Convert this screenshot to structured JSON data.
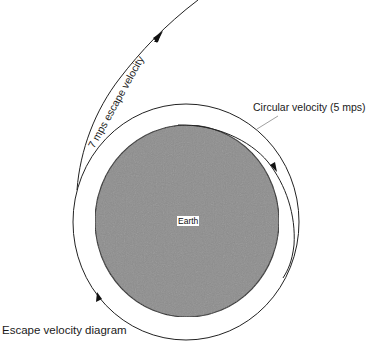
{
  "diagram": {
    "title": "Escape velocity diagram",
    "body": {
      "name": "Earth",
      "fill_color": "#8c8c8c",
      "outline_color": "#2a2a2a"
    },
    "orbits": [
      {
        "name": "circular-orbit",
        "label": "Circular velocity (5 mps)",
        "direction": "clockwise"
      },
      {
        "name": "escape-trajectory",
        "label": "7 mps escape velocity",
        "direction": "outward"
      }
    ],
    "line_color": "#222222",
    "background_color": "#ffffff"
  }
}
